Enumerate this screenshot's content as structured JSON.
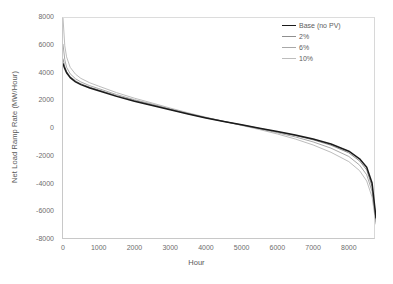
{
  "chart_data": {
    "type": "line",
    "title": "",
    "xlabel": "Hour",
    "ylabel": "Net Load Ramp Rate (MW/Hour)",
    "xlim": [
      0,
      8760
    ],
    "ylim": [
      -8000,
      8000
    ],
    "xticks": [
      0,
      1000,
      2000,
      3000,
      4000,
      5000,
      6000,
      7000,
      8000
    ],
    "yticks": [
      8000,
      6000,
      4000,
      2000,
      0,
      -2000,
      -4000,
      -6000,
      -8000
    ],
    "grid": false,
    "legend_position": "top-right",
    "x": [
      0,
      50,
      100,
      200,
      350,
      500,
      750,
      1000,
      1500,
      2000,
      2500,
      3000,
      3500,
      4000,
      4500,
      5000,
      5500,
      6000,
      6500,
      7000,
      7500,
      8000,
      8300,
      8500,
      8650,
      8760
    ],
    "series": [
      {
        "name": "Base (no PV)",
        "color": "#1a1a1a",
        "width": 1.5,
        "values": [
          4700,
          4350,
          4050,
          3700,
          3400,
          3200,
          2950,
          2750,
          2350,
          2000,
          1700,
          1380,
          1080,
          800,
          540,
          300,
          60,
          -180,
          -430,
          -720,
          -1080,
          -1600,
          -2150,
          -2750,
          -3900,
          -6400
        ]
      },
      {
        "name": "2%",
        "color": "#8f8f8f",
        "width": 1,
        "values": [
          5050,
          4500,
          4150,
          3780,
          3470,
          3260,
          3010,
          2810,
          2400,
          2050,
          1740,
          1410,
          1100,
          810,
          545,
          295,
          45,
          -205,
          -470,
          -780,
          -1170,
          -1720,
          -2300,
          -2950,
          -4150,
          -6550
        ]
      },
      {
        "name": "6%",
        "color": "#a8a8a8",
        "width": 1,
        "values": [
          6100,
          5000,
          4450,
          3980,
          3620,
          3390,
          3120,
          2910,
          2480,
          2110,
          1790,
          1450,
          1130,
          830,
          550,
          280,
          10,
          -270,
          -570,
          -930,
          -1380,
          -1980,
          -2600,
          -3300,
          -4500,
          -6700
        ]
      },
      {
        "name": "10%",
        "color": "#bdbdbd",
        "width": 1,
        "values": [
          8000,
          6000,
          5200,
          4450,
          3950,
          3650,
          3330,
          3090,
          2620,
          2220,
          1870,
          1510,
          1170,
          850,
          550,
          255,
          -40,
          -360,
          -720,
          -1150,
          -1680,
          -2350,
          -3000,
          -3750,
          -4900,
          -6850
        ]
      }
    ]
  },
  "legend": {
    "items": [
      {
        "label": "Base (no PV)"
      },
      {
        "label": "2%"
      },
      {
        "label": "6%"
      },
      {
        "label": "10%"
      }
    ]
  }
}
